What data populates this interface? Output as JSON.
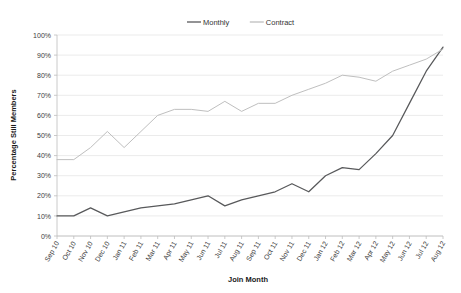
{
  "chart_data": {
    "type": "line",
    "title": "",
    "xlabel": "Join Month",
    "ylabel": "Percentage Still Members",
    "ylim": [
      0,
      100
    ],
    "ytick_labels": [
      "0%",
      "10%",
      "20%",
      "30%",
      "40%",
      "50%",
      "60%",
      "70%",
      "80%",
      "90%",
      "100%"
    ],
    "ytick_values": [
      0,
      10,
      20,
      30,
      40,
      50,
      60,
      70,
      80,
      90,
      100
    ],
    "grid": true,
    "legend_position": "top-center",
    "categories": [
      "Sep 10",
      "Oct 10",
      "Nov 10",
      "Dec 10",
      "Jan 11",
      "Feb 11",
      "Mar 11",
      "Apr 11",
      "May 11",
      "Jun 11",
      "Jul 11",
      "Aug 11",
      "Sep 11",
      "Oct 11",
      "Nov 11",
      "Dec 11",
      "Jan 12",
      "Feb 12",
      "Mar 12",
      "Apr 12",
      "May 12",
      "Jun 12",
      "Jul 12",
      "Aug 12"
    ],
    "series": [
      {
        "name": "Monthly",
        "color": "#58595b",
        "values": [
          10,
          10,
          14,
          10,
          12,
          14,
          15,
          16,
          18,
          20,
          15,
          18,
          20,
          22,
          26,
          22,
          30,
          34,
          33,
          41,
          50,
          66,
          82,
          94
        ]
      },
      {
        "name": "Contract",
        "color": "#bfbfbf",
        "values": [
          38,
          38,
          44,
          52,
          44,
          52,
          60,
          63,
          63,
          62,
          67,
          62,
          66,
          66,
          70,
          73,
          76,
          80,
          79,
          77,
          82,
          85,
          88,
          93
        ]
      }
    ]
  },
  "legend": {
    "items": [
      {
        "label": "Monthly",
        "color": "#58595b"
      },
      {
        "label": "Contract",
        "color": "#bfbfbf"
      }
    ]
  },
  "axes": {
    "y_title": "Percentage Still Members",
    "x_title": "Join Month"
  }
}
